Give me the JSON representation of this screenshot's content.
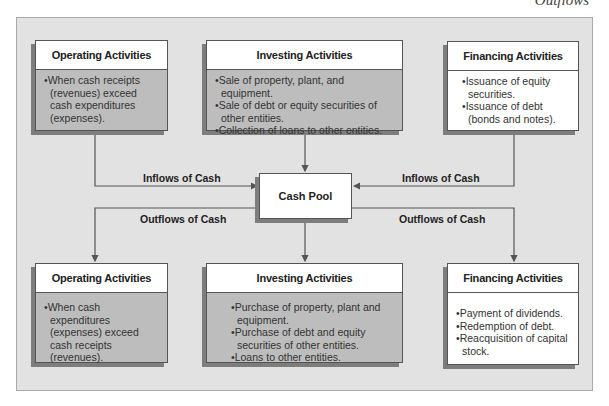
{
  "page": {
    "corner_title": "Outflows"
  },
  "top_row": [
    {
      "title": "Operating Activities",
      "items": [
        "When cash receipts (revenues) exceed cash expenditures (expenses)."
      ]
    },
    {
      "title": "Investing Activities",
      "items": [
        "Sale of property, plant, and equipment.",
        "Sale of debt or equity securities of other entities.",
        "Collection of loans to other entities."
      ]
    },
    {
      "title": "Financing Activities",
      "items": [
        "Issuance of equity securities.",
        "Issuance of debt (bonds and notes)."
      ]
    }
  ],
  "center": {
    "label": "Cash Pool"
  },
  "flows": {
    "inflow_left": "Inflows of Cash",
    "inflow_right": "Inflows of Cash",
    "outflow_left": "Outflows of Cash",
    "outflow_right": "Outflows of Cash"
  },
  "bottom_row": [
    {
      "title": "Operating Activities",
      "items": [
        "When cash expenditures (expenses) exceed cash receipts (revenues)."
      ]
    },
    {
      "title": "Investing Activities",
      "items": [
        "Purchase of property, plant and equipment.",
        "Purchase of debt and equity securities of other entities.",
        "Loans to other entities."
      ]
    },
    {
      "title": "Financing Activities",
      "items": [
        "Payment of dividends.",
        "Redemption of debt.",
        "Reacquisition of capital stock."
      ]
    }
  ],
  "colors": {
    "panel": "#e2e2e2",
    "gray_body": "#bdbdbd",
    "line": "#555555"
  }
}
